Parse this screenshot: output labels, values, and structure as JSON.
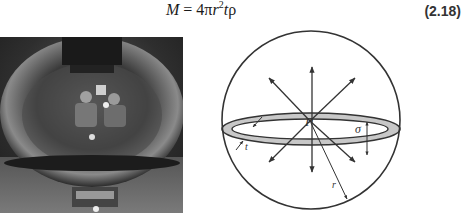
{
  "equation": {
    "lhs": "M",
    "equals": " = 4",
    "pi": "π",
    "r": "r",
    "exp": "2",
    "t": "t",
    "rho": "ρ",
    "number": "(2.18)"
  },
  "photo": {
    "description": "Grayscale photo of two people reflected inside a metallic spherical pressure vessel"
  },
  "diagram": {
    "labels": {
      "P": "P",
      "sigma": "σ",
      "t": "t",
      "r": "r"
    },
    "colors": {
      "stroke": "#333333",
      "band_fill": "#c8c8c8"
    }
  }
}
